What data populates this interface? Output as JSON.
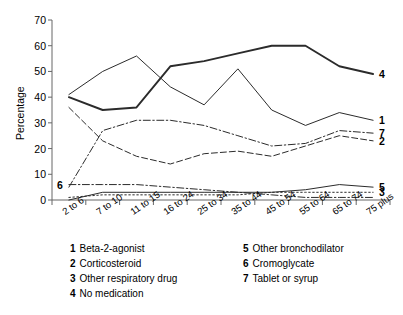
{
  "chart_data": {
    "type": "line",
    "title": "",
    "xlabel": "",
    "ylabel": "Percentage",
    "ylim": [
      0,
      70
    ],
    "yticks": [
      0,
      10,
      20,
      30,
      40,
      50,
      60,
      70
    ],
    "grid": false,
    "legend_position": "below",
    "categories": [
      "2 to 6",
      "7 to 10",
      "11 to 15",
      "16 to 24",
      "25 to 34",
      "35 to 44",
      "45 to 54",
      "55 to 64",
      "65 to 74",
      "75 plus"
    ],
    "series": [
      {
        "name": "Beta-2-agonist",
        "key": "1",
        "style": "solid",
        "end_label": "1",
        "values": [
          41,
          50,
          56,
          44,
          37,
          51,
          35,
          29,
          34,
          31
        ]
      },
      {
        "name": "Corticosteroid",
        "key": "2",
        "style": "dashed",
        "end_label": "2",
        "values": [
          36,
          23,
          17,
          14,
          18,
          19,
          17,
          21,
          25,
          23
        ]
      },
      {
        "name": "Other respiratory drug",
        "key": "3",
        "style": "dotted",
        "end_label": "3",
        "values": [
          1,
          2,
          2,
          2,
          2,
          2,
          3,
          3,
          3,
          3
        ]
      },
      {
        "name": "No medication",
        "key": "4",
        "style": "solid-thick",
        "end_label": "4",
        "values": [
          40,
          35,
          36,
          52,
          54,
          57,
          60,
          60,
          52,
          49
        ]
      },
      {
        "name": "Other bronchodilator",
        "key": "5",
        "style": "solid",
        "end_label": "5",
        "values": [
          0,
          3,
          3,
          3,
          3,
          3,
          3,
          4,
          6,
          5
        ]
      },
      {
        "name": "Cromoglycate",
        "key": "6",
        "style": "dashdot",
        "inline_label": "6",
        "values": [
          6,
          6,
          6,
          5,
          4,
          3,
          2,
          1,
          1,
          1
        ]
      },
      {
        "name": "Tablet or syrup",
        "key": "7",
        "style": "dashdot",
        "end_label": "7",
        "values": [
          5,
          27,
          31,
          31,
          29,
          25,
          21,
          22,
          27,
          26
        ]
      }
    ]
  },
  "legend": {
    "columns": [
      {
        "items": [
          {
            "num": "1",
            "text": "Beta-2-agonist"
          },
          {
            "num": "2",
            "text": "Corticosteroid"
          },
          {
            "num": "3",
            "text": "Other respiratory drug"
          },
          {
            "num": "4",
            "text": "No medication"
          }
        ]
      },
      {
        "items": [
          {
            "num": "5",
            "text": "Other bronchodilator"
          },
          {
            "num": "6",
            "text": "Cromoglycate"
          },
          {
            "num": "7",
            "text": "Tablet or syrup"
          }
        ]
      }
    ]
  },
  "colors": {
    "line": "#2b2b2b",
    "axis": "#555555",
    "text": "#000000"
  }
}
